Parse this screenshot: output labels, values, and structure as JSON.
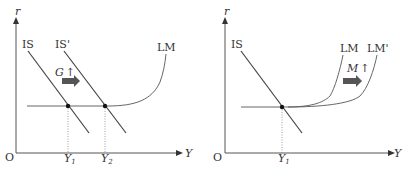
{
  "diagrams": [
    {
      "id": "fiscal",
      "axis_y": "r",
      "axis_x": "Y",
      "origin": "O",
      "curves": [
        {
          "label": "IS"
        },
        {
          "label": "IS'"
        },
        {
          "label": "LM"
        }
      ],
      "shift_annotation": {
        "var": "G",
        "dir": "↑"
      },
      "x_ticks": [
        {
          "main": "Y",
          "sub": "1"
        },
        {
          "main": "Y",
          "sub": "2"
        }
      ]
    },
    {
      "id": "monetary",
      "axis_y": "r",
      "axis_x": "Y",
      "origin": "O",
      "curves": [
        {
          "label": "IS"
        },
        {
          "label": "LM"
        },
        {
          "label": "LM'"
        }
      ],
      "shift_annotation": {
        "var": "M",
        "dir": "↑"
      },
      "x_ticks": [
        {
          "main": "Y",
          "sub": "1"
        }
      ]
    }
  ],
  "colors": {
    "line": "#444444",
    "axis": "#555555",
    "arrow": "#555555",
    "dotted": "#888888"
  }
}
